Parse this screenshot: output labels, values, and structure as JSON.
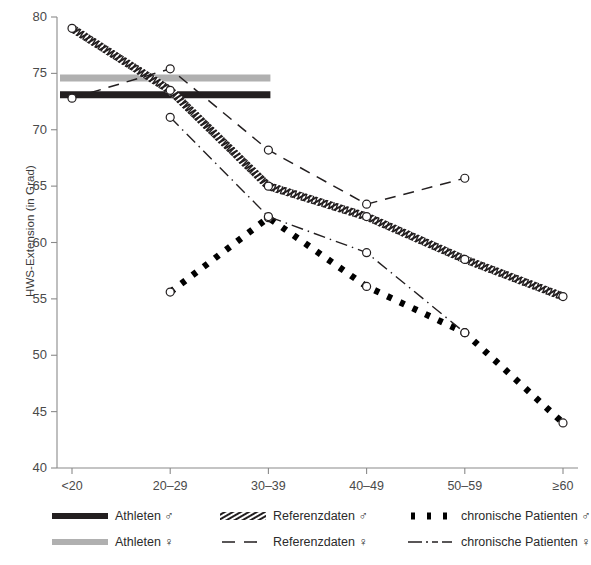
{
  "chart_data": {
    "type": "line",
    "title": "",
    "xlabel": "",
    "ylabel": "HWS-Extension (in Grad)",
    "categories": [
      "<20",
      "20–29",
      "30–39",
      "40–49",
      "50–59",
      "≥60"
    ],
    "ylim": [
      40,
      80
    ],
    "yticks": [
      40,
      45,
      50,
      55,
      60,
      65,
      70,
      75,
      80
    ],
    "grid": false,
    "legend_position": "bottom",
    "series": [
      {
        "name": "Athleten ♂",
        "style": "solid-thick-band",
        "color": "#231f20",
        "constant_value": 73.1,
        "x_span": [
          "<20",
          "30–39"
        ],
        "values": [
          73.1,
          73.1,
          73.1,
          null,
          null,
          null
        ]
      },
      {
        "name": "Athleten ♀",
        "style": "solid-thick-band",
        "color": "#b0b0b0",
        "constant_value": 74.6,
        "x_span": [
          "<20",
          "30–39"
        ],
        "values": [
          74.6,
          74.6,
          74.6,
          null,
          null,
          null
        ]
      },
      {
        "name": "Referenzdaten ♂",
        "style": "hatched",
        "color": "#231f20",
        "markers": true,
        "values": [
          79.0,
          73.5,
          65.0,
          62.3,
          58.5,
          55.2
        ]
      },
      {
        "name": "Referenzdaten ♀",
        "style": "dashed",
        "color": "#231f20",
        "markers": true,
        "values": [
          72.8,
          75.4,
          68.2,
          63.4,
          65.7,
          null
        ]
      },
      {
        "name": "chronische Patienten ♂",
        "style": "thick-dotted",
        "color": "#000000",
        "markers": true,
        "values": [
          null,
          55.6,
          62.2,
          56.1,
          52.0,
          44.0
        ]
      },
      {
        "name": "chronische Patienten ♀",
        "style": "dash-dot",
        "color": "#231f20",
        "markers": true,
        "values": [
          null,
          71.1,
          62.3,
          59.1,
          52.0,
          null
        ]
      }
    ]
  },
  "axes": {
    "y_title": "HWS-Extension (in Grad)",
    "y_tick_labels": [
      "80",
      "75",
      "70",
      "65",
      "60",
      "55",
      "50",
      "45",
      "40"
    ],
    "x_tick_labels": [
      "<20",
      "20–29",
      "30–39",
      "40–49",
      "50–59",
      "≥60"
    ]
  },
  "legend": {
    "items": [
      {
        "label": "Athleten",
        "sex": "♂",
        "full": "Athleten ♂",
        "swatch": "solid-dark-band"
      },
      {
        "label": "Referenzdaten",
        "sex": "♂",
        "full": "Referenzdaten ♂",
        "swatch": "hatched"
      },
      {
        "label": "chronische Patienten",
        "sex": "♂",
        "full": "chronische Patienten ♂",
        "swatch": "thick-dotted"
      },
      {
        "label": "Athleten",
        "sex": "♀",
        "full": "Athleten ♀",
        "swatch": "solid-gray-band"
      },
      {
        "label": "Referenzdaten",
        "sex": "♀",
        "full": "Referenzdaten ♀",
        "swatch": "dashed"
      },
      {
        "label": "chronische Patienten",
        "sex": "♀",
        "full": "chronische Patienten ♀",
        "swatch": "dash-dot"
      }
    ]
  },
  "colors": {
    "athletes_male": "#231f20",
    "athletes_female": "#b0b0b0",
    "ink": "#231f20",
    "axis": "#8a8a8a",
    "background": "#ffffff"
  }
}
